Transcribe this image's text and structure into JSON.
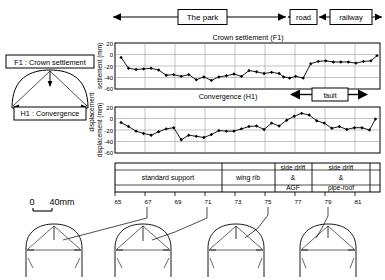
{
  "figure": {
    "scale_bar": {
      "zero": "0",
      "label": "40mm"
    }
  },
  "zones": [
    {
      "name": "park",
      "label": "The park"
    },
    {
      "name": "road",
      "label": "road"
    },
    {
      "name": "railway",
      "label": "railway"
    }
  ],
  "legend": {
    "crown": "F1 : Crown settlement",
    "convergence": "H1 : Convergence"
  },
  "fault": {
    "label": "fault"
  },
  "support": {
    "segments": [
      {
        "label": "standard support",
        "label2": "",
        "label3": ""
      },
      {
        "label": "wing rib",
        "label2": "",
        "label3": ""
      },
      {
        "label": "side drift",
        "label2": "&",
        "label3": "AGF"
      },
      {
        "label": "side drift",
        "label2": "&",
        "label3": "pipe-roof"
      }
    ]
  },
  "axis": {
    "x_ticks": [
      "65",
      "67",
      "69",
      "71",
      "73",
      "75",
      "77",
      "79",
      "81"
    ],
    "y_ticks": [
      "20",
      "0",
      "-20",
      "-40",
      "-60"
    ],
    "y_label_top": "settlement  (mm)",
    "y_label_bottom": "displacement  (mm)",
    "y_label_outer": "displacement"
  },
  "chart_data": [
    {
      "type": "line",
      "name": "crown-settlement",
      "title": "Crown settlement (F1)",
      "xlabel": "",
      "ylabel": "settlement  (mm)",
      "xlim": [
        64.2,
        81.8
      ],
      "ylim": [
        -60,
        20
      ],
      "yticks": [
        20,
        0,
        -20,
        -40,
        -60
      ],
      "xticks": [
        65,
        67,
        69,
        71,
        73,
        75,
        77,
        79,
        81
      ],
      "grid": true,
      "marker": "filled-diamond",
      "x": [
        64.6,
        65.1,
        65.6,
        66.1,
        66.6,
        67.1,
        67.6,
        68.1,
        68.6,
        69.1,
        69.6,
        70.1,
        70.6,
        71.1,
        71.6,
        72.1,
        72.6,
        73.1,
        73.6,
        74.1,
        74.6,
        75.1,
        75.4,
        75.8,
        76.2,
        76.7,
        77.2,
        77.7,
        78.2,
        78.7,
        79.2,
        79.7,
        80.2,
        80.7,
        81.2,
        81.6
      ],
      "values": [
        -5,
        -24,
        -26,
        -25,
        -24,
        -27,
        -36,
        -35,
        -38,
        -35,
        -44,
        -39,
        -45,
        -39,
        -37,
        -34,
        -38,
        -28,
        -30,
        -33,
        -31,
        -33,
        -39,
        -41,
        -38,
        -41,
        -16,
        -12,
        -11,
        -13,
        -13,
        -13,
        -15,
        -12,
        -11,
        -2
      ]
    },
    {
      "type": "line",
      "name": "convergence",
      "title": "Convergence  (H1)",
      "xlabel": "",
      "ylabel": "displacement  (mm)",
      "xlim": [
        64.2,
        81.8
      ],
      "ylim": [
        -60,
        20
      ],
      "yticks": [
        20,
        0,
        -20,
        -40,
        -60
      ],
      "xticks": [
        65,
        67,
        69,
        71,
        73,
        75,
        77,
        79,
        81
      ],
      "grid": true,
      "marker": "filled-diamond",
      "x": [
        64.6,
        65.1,
        65.6,
        66.1,
        66.6,
        67.1,
        67.6,
        68.1,
        68.6,
        69.1,
        69.6,
        70.1,
        70.6,
        71.1,
        71.6,
        72.1,
        72.6,
        73.1,
        73.6,
        74.1,
        74.6,
        75.1,
        75.6,
        76.1,
        76.6,
        77.1,
        77.6,
        78.1,
        78.6,
        79.1,
        79.6,
        80.1,
        80.6,
        81.1,
        81.5
      ],
      "values": [
        -7,
        -14,
        -22,
        -26,
        -29,
        -23,
        -18,
        -16,
        -37,
        -29,
        -31,
        -33,
        -28,
        -21,
        -22,
        -22,
        -18,
        -14,
        -13,
        -19,
        -8,
        -13,
        -3,
        4,
        9,
        6,
        -4,
        -8,
        -17,
        -14,
        -19,
        -16,
        -16,
        -20,
        -1
      ]
    }
  ],
  "sections": [
    {
      "name": "section-1"
    },
    {
      "name": "section-2"
    },
    {
      "name": "section-3"
    },
    {
      "name": "section-4"
    }
  ]
}
